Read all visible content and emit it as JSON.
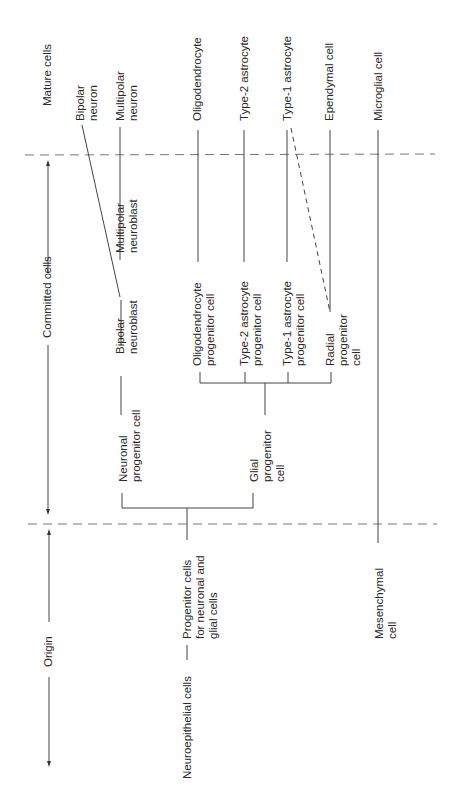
{
  "stages": {
    "mature": "Mature cells",
    "committed": "Committed cells",
    "origin": "Origin"
  },
  "mature_cells": {
    "bipolar_neuron": "Bipolar\nneuron",
    "multipolar_neuron": "Multipolar\nneuron",
    "oligodendrocyte": "Oligodendrocyte",
    "type2_astrocyte": "Type-2 astrocyte",
    "type1_astrocyte": "Type-1 astrocyte",
    "ependymal_cell": "Ependymal cell",
    "microglial_cell": "Microglial cell"
  },
  "committed_cells": {
    "multipolar_neuroblast": "Multipolar\nneuroblast",
    "bipolar_neuroblast": "Bipolar\nneuroblast",
    "oligodendrocyte_progenitor": "Oligodendrocyte\nprogenitor cell",
    "type2_astrocyte_progenitor": "Type-2 astrocyte\nprogenitor cell",
    "type1_astrocyte_progenitor": "Type-1 astrocyte\nprogenitor cell",
    "radial_progenitor": "Radial\nprogenitor\ncell",
    "neuronal_progenitor": "Neuronal\nprogenitor cell",
    "glial_progenitor": "Glial\nprogenitor\ncell"
  },
  "origin_cells": {
    "neuroepithelial": "Neuroepithelial cells",
    "progenitor_neuronal_glial": "Progenitor cells\nfor neuronal and\nglial cells",
    "mesenchymal": "Mesenchymal\ncell"
  }
}
